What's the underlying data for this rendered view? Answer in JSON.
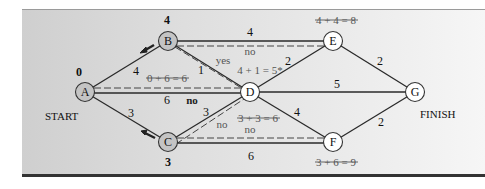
{
  "diagram": {
    "type": "shortest-route network",
    "colors": {
      "visited_node_fill": "#c4c4c4",
      "unvisited_node_fill": "#ffffff",
      "edge": "#2a2a2a",
      "annotation": "#555555"
    },
    "nodes": [
      {
        "id": "A",
        "label": "A",
        "x": 85,
        "y": 92,
        "visited": true,
        "value": "0"
      },
      {
        "id": "B",
        "label": "B",
        "x": 168,
        "y": 41,
        "visited": true,
        "value": "4"
      },
      {
        "id": "C",
        "label": "C",
        "x": 168,
        "y": 142,
        "visited": true,
        "value": "3"
      },
      {
        "id": "D",
        "label": "D",
        "x": 250,
        "y": 92,
        "visited": false,
        "value": ""
      },
      {
        "id": "E",
        "label": "E",
        "x": 333,
        "y": 41,
        "visited": false,
        "value": ""
      },
      {
        "id": "F",
        "label": "F",
        "x": 333,
        "y": 142,
        "visited": false,
        "value": ""
      },
      {
        "id": "G",
        "label": "G",
        "x": 415,
        "y": 92,
        "visited": false,
        "value": ""
      }
    ],
    "edges": [
      {
        "from": "A",
        "to": "B",
        "weight": "4"
      },
      {
        "from": "A",
        "to": "C",
        "weight": "3"
      },
      {
        "from": "A",
        "to": "D",
        "weight": "6"
      },
      {
        "from": "B",
        "to": "D",
        "weight": "1"
      },
      {
        "from": "B",
        "to": "E",
        "weight": "4"
      },
      {
        "from": "C",
        "to": "D",
        "weight": "3"
      },
      {
        "from": "C",
        "to": "F",
        "weight": "6"
      },
      {
        "from": "D",
        "to": "E",
        "weight": "2"
      },
      {
        "from": "D",
        "to": "G",
        "weight": "5"
      },
      {
        "from": "D",
        "to": "F",
        "weight": "4"
      },
      {
        "from": "E",
        "to": "G",
        "weight": "2"
      },
      {
        "from": "F",
        "to": "G",
        "weight": "2"
      }
    ],
    "labels": {
      "start": "START",
      "finish": "FINISH",
      "node_a_value": "0",
      "node_b_value": "4",
      "node_c_value": "3",
      "edge_ab": "4",
      "edge_ac": "3",
      "edge_ad": "6",
      "edge_bd": "1",
      "edge_be": "4",
      "edge_cd": "3",
      "edge_cf": "6",
      "edge_de": "2",
      "edge_dg": "5",
      "edge_df": "4",
      "edge_eg": "2",
      "edge_fg": "2",
      "calc_ad": "0 + 6 = 6",
      "calc_bd": "4 + 1 = 5*",
      "calc_be": "4 + 4 = 8",
      "calc_cd": "3 + 3 = 6",
      "calc_cf": "3 + 6 = 9",
      "yes_bd": "yes",
      "no_be": "no",
      "no_ad": "no",
      "no_cd": "no",
      "no_cf": "no"
    }
  }
}
